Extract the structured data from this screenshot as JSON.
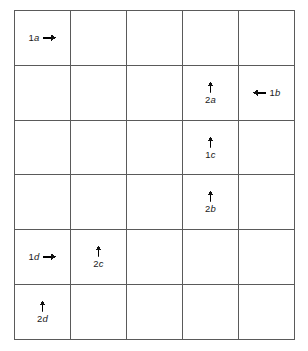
{
  "figure": {
    "type": "grid-diagram",
    "grid": {
      "columns": 5,
      "rows": 6,
      "line_color": "#5a5a5a",
      "background_color": "#ffffff"
    },
    "markers": [
      {
        "id": "marker-1a",
        "label": "1a",
        "index": "1",
        "sub": "a",
        "row": 1,
        "column": 1,
        "arrow_direction": "right",
        "arrow_icon": "arrow-right-icon",
        "layout": "inline"
      },
      {
        "id": "marker-2a",
        "label": "2a",
        "index": "2",
        "sub": "a",
        "row": 2,
        "column": 4,
        "arrow_direction": "up",
        "arrow_icon": "arrow-up-icon",
        "layout": "stacked"
      },
      {
        "id": "marker-1b",
        "label": "1b",
        "index": "1",
        "sub": "b",
        "row": 2,
        "column": 5,
        "arrow_direction": "left",
        "arrow_icon": "arrow-left-icon",
        "layout": "inline"
      },
      {
        "id": "marker-1c",
        "label": "1c",
        "index": "1",
        "sub": "c",
        "row": 3,
        "column": 4,
        "arrow_direction": "up",
        "arrow_icon": "arrow-up-icon",
        "layout": "stacked"
      },
      {
        "id": "marker-2b",
        "label": "2b",
        "index": "2",
        "sub": "b",
        "row": 4,
        "column": 4,
        "arrow_direction": "up",
        "arrow_icon": "arrow-up-icon",
        "layout": "stacked"
      },
      {
        "id": "marker-1d",
        "label": "1d",
        "index": "1",
        "sub": "d",
        "row": 5,
        "column": 1,
        "arrow_direction": "right",
        "arrow_icon": "arrow-right-icon",
        "layout": "inline"
      },
      {
        "id": "marker-2c",
        "label": "2c",
        "index": "2",
        "sub": "c",
        "row": 5,
        "column": 2,
        "arrow_direction": "up",
        "arrow_icon": "arrow-up-icon",
        "layout": "stacked"
      },
      {
        "id": "marker-2d",
        "label": "2d",
        "index": "2",
        "sub": "d",
        "row": 6,
        "column": 1,
        "arrow_direction": "up",
        "arrow_icon": "arrow-up-icon",
        "layout": "stacked"
      }
    ]
  }
}
